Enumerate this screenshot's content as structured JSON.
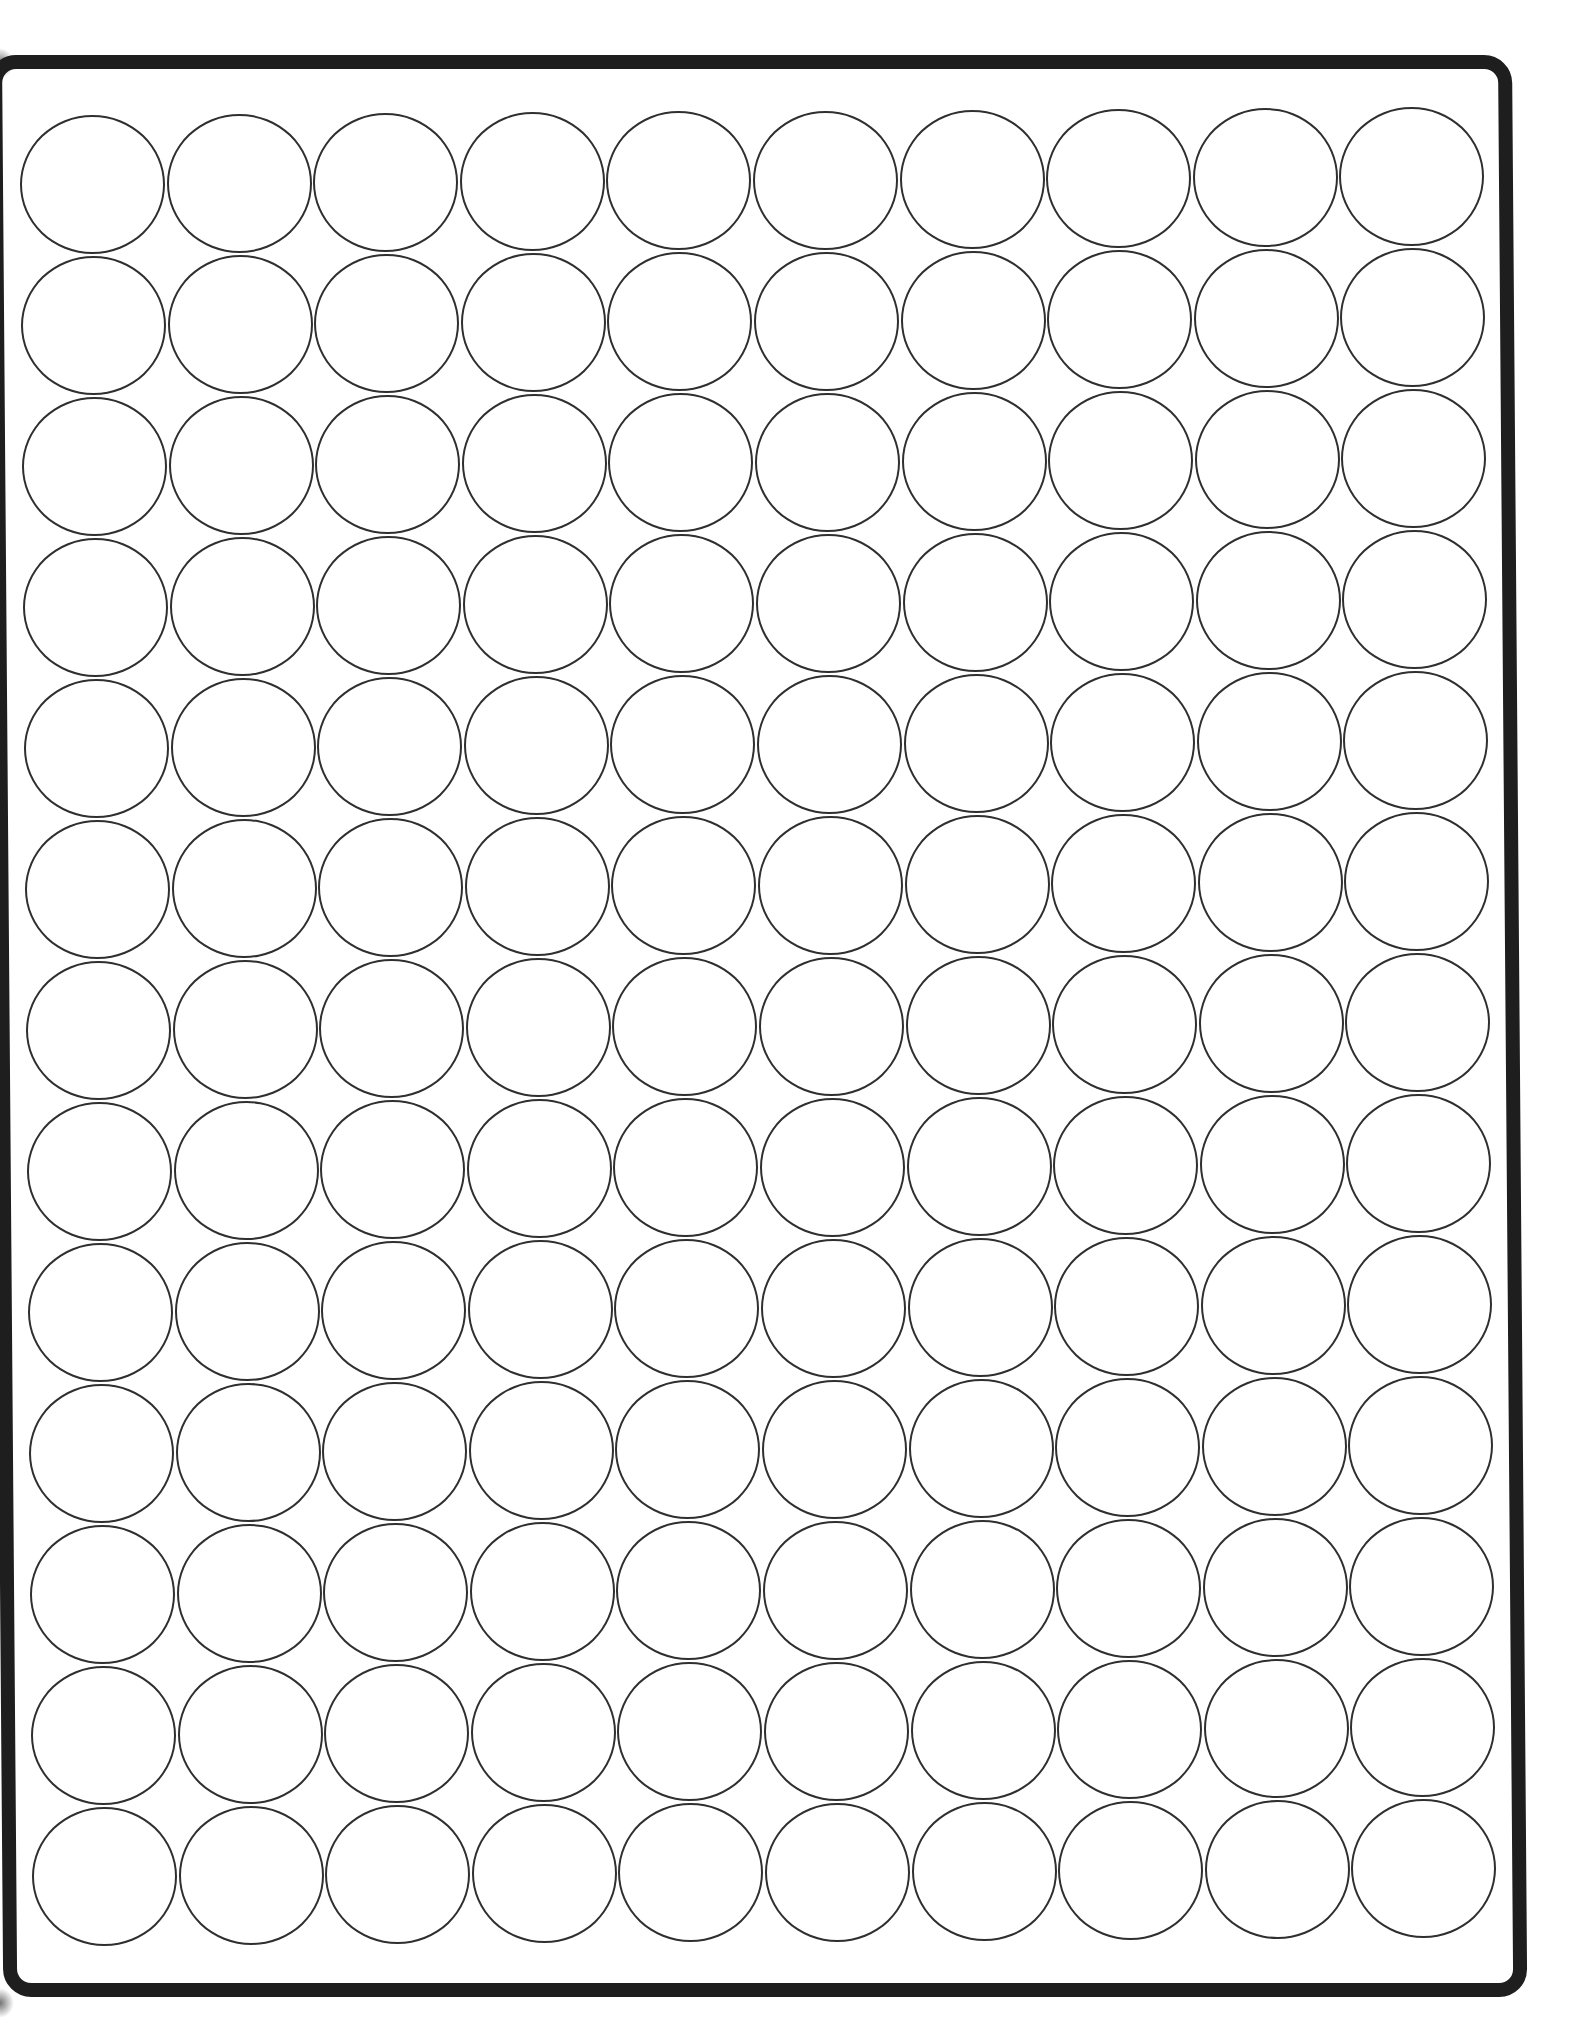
{
  "document": {
    "type": "round-label-sheet",
    "columns": 10,
    "rows": 13,
    "total_labels": 130,
    "colors": {
      "border": "#1e1e1e",
      "label_outline": "#2f2f2f",
      "background": "#ffffff"
    }
  }
}
